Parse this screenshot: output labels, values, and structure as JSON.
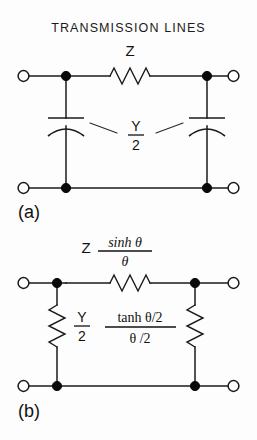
{
  "figure": {
    "title": "TRANSMISSION LINES",
    "background_color": "#fdfdfd",
    "ink_color": "#1a1a1a"
  },
  "circuits": [
    {
      "id": "a",
      "caption": "(a)",
      "kind": "nominal-pi-section",
      "series_element": {
        "type": "resistor",
        "orientation": "horizontal",
        "label": "Z"
      },
      "shunt_elements": [
        {
          "type": "capacitor",
          "orientation": "vertical",
          "position": "left"
        },
        {
          "type": "capacitor",
          "orientation": "vertical",
          "position": "right"
        }
      ],
      "shunt_label": {
        "numerator": "Y",
        "denominator": "2"
      },
      "terminals": 4
    },
    {
      "id": "b",
      "caption": "(b)",
      "kind": "equivalent-pi-section",
      "series_element": {
        "type": "resistor",
        "orientation": "horizontal",
        "label_lead": "Z",
        "label_numerator": "sinh θ",
        "label_denominator": "θ"
      },
      "shunt_elements": [
        {
          "type": "resistor",
          "orientation": "vertical",
          "position": "left"
        },
        {
          "type": "resistor",
          "orientation": "vertical",
          "position": "right"
        }
      ],
      "shunt_label": {
        "first_numerator": "Y",
        "first_denominator": "2",
        "second_numerator": "tanh θ/2",
        "second_denominator": "θ /2"
      },
      "terminals": 4
    }
  ]
}
